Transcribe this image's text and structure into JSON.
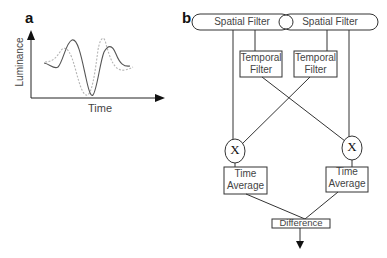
{
  "panel_a": {
    "label": "a",
    "ylabel": "Luminance",
    "xlabel": "Time",
    "series": [
      {
        "name": "solid-waveform",
        "style": "solid",
        "color": "#555555"
      },
      {
        "name": "dotted-waveform",
        "style": "dotted",
        "color": "#aaaaaa"
      }
    ]
  },
  "panel_b": {
    "label": "b",
    "spatial_filter_left": "Spatial Filter",
    "spatial_filter_right": "Spatial Filter",
    "temporal_filter_left_1": "Temporal",
    "temporal_filter_left_2": "Filter",
    "temporal_filter_right_1": "Temporal",
    "temporal_filter_right_2": "Filter",
    "multiply_left": "X",
    "multiply_right": "X",
    "time_average_left_1": "Time",
    "time_average_left_2": "Average",
    "time_average_right_1": "Time",
    "time_average_right_2": "Average",
    "difference": "Difference"
  }
}
